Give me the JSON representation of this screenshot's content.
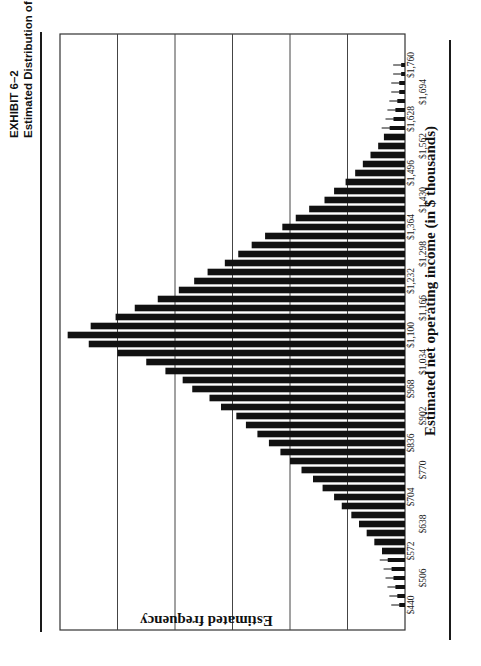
{
  "header": {
    "exhibit": "EXHIBIT 6–2",
    "caption": "Estimated Distribution of First Year (Stabilized) NOI Alternative"
  },
  "chart_data": {
    "type": "bar",
    "orientation": "rotated 90° counter-clockwise on page (histogram)",
    "title": "Estimated Distribution of First Year (Stabilized) NOI Alternative",
    "xlabel": "Estimated net operating income (in $ thousands)",
    "ylabel": "Estimated frequency",
    "grid": true,
    "gridlines_count": 6,
    "bin_width": 22,
    "tick_labels": [
      "$440",
      "$506",
      "$572",
      "$638",
      "$704",
      "$770",
      "$836",
      "$902",
      "$968",
      "$1,034",
      "$1,100",
      "$1,166",
      "$1,232",
      "$1,298",
      "$1,364",
      "$1,430",
      "$1,496",
      "$1,562",
      "$1,628",
      "$1,694",
      "$1,760"
    ],
    "categories": [
      440,
      462,
      484,
      506,
      528,
      550,
      572,
      594,
      616,
      638,
      660,
      682,
      704,
      726,
      748,
      770,
      792,
      814,
      836,
      858,
      880,
      902,
      924,
      946,
      968,
      990,
      1012,
      1034,
      1056,
      1078,
      1100,
      1122,
      1144,
      1166,
      1188,
      1210,
      1232,
      1254,
      1276,
      1298,
      1320,
      1342,
      1364,
      1386,
      1408,
      1430,
      1452,
      1474,
      1496,
      1518,
      1540,
      1562,
      1584,
      1606,
      1628,
      1650,
      1672,
      1694,
      1716,
      1738,
      1760
    ],
    "values": [
      0.3,
      0.4,
      0.5,
      0.6,
      0.7,
      0.9,
      1.2,
      1.6,
      2.0,
      2.4,
      2.8,
      3.3,
      3.7,
      4.3,
      4.8,
      5.4,
      6.0,
      6.5,
      7.1,
      7.7,
      8.3,
      8.8,
      9.6,
      10.2,
      11.1,
      11.6,
      12.5,
      13.5,
      15.0,
      16.5,
      17.6,
      16.4,
      15.1,
      14.1,
      12.9,
      11.8,
      11.0,
      10.3,
      9.4,
      8.7,
      8.0,
      7.3,
      6.4,
      5.7,
      5.0,
      4.2,
      3.7,
      3.1,
      2.6,
      2.2,
      1.8,
      1.4,
      1.1,
      0.8,
      0.6,
      0.5,
      0.4,
      0.3,
      0.3,
      0.2,
      0.2
    ],
    "ylim": [
      0,
      18
    ],
    "legend": null
  }
}
